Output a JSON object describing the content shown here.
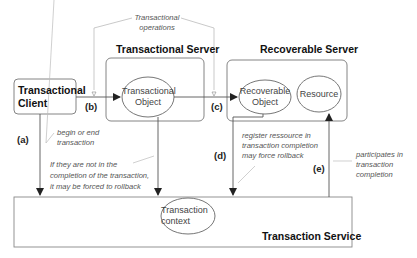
{
  "diagram": {
    "nodes": {
      "client": {
        "label_line1": "Transactional",
        "label_line2": "Client"
      },
      "transactional_server": {
        "title": "Transactional Server"
      },
      "transactional_object": {
        "label_line1": "Transactional",
        "label_line2": "Object"
      },
      "recoverable_server": {
        "title": "Recoverable Server"
      },
      "recoverable_object": {
        "label_line1": "Recoverable",
        "label_line2": "Object"
      },
      "resource": {
        "label": "Resource"
      },
      "transaction_service": {
        "title": "Transaction Service"
      },
      "transaction_context": {
        "label_line1": "Transaction",
        "label_line2": "context"
      }
    },
    "edge_tags": {
      "a": "(a)",
      "b": "(b)",
      "c": "(c)",
      "d": "(d)",
      "e": "(e)"
    },
    "annotations": {
      "transactional_operations": {
        "line1": "Transactional",
        "line2": "operations"
      },
      "begin_end": {
        "line1": "begin or end",
        "line2": "transaction"
      },
      "forced_rollback": {
        "line1": "If they are not in the",
        "line2": "completion of the transaction,",
        "line3": "it may be forced to rollback"
      },
      "register_resource": {
        "line1": "register ressource in",
        "line2": "transaction completion",
        "line3": "may force rollback"
      },
      "participates": {
        "line1": "participates in",
        "line2": "transaction",
        "line3": "completion"
      }
    },
    "colors": {
      "stroke": "#555555",
      "light_stroke": "#bbbbbb",
      "text": "#222222"
    }
  }
}
